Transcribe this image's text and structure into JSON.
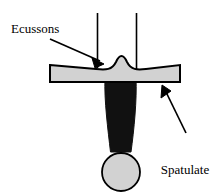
{
  "figure": {
    "background_color": "#ffffff",
    "width": 221,
    "height": 196
  },
  "labels": {
    "ecussons": {
      "text": "Ecussons",
      "points_to": "central-bump"
    },
    "spatulate": {
      "line1": "Spatulate",
      "line2": "ends",
      "points_to": "horizontal-bar-right"
    }
  },
  "colors": {
    "outline": "#000000",
    "gray_fill": "#d2d2d2",
    "dark_fill": "#111111",
    "background": "#ffffff"
  },
  "shapes": {
    "horizontal_bar": {
      "name": "spatulate-bar",
      "fill": "#d2d2d2",
      "stroke": "#000000",
      "left": 50,
      "right": 180,
      "top": 65,
      "bottom": 82
    },
    "central_bump": {
      "name": "ecussons-bump",
      "peak_x": 120,
      "peak_y": 57
    },
    "stem": {
      "name": "dark-stem",
      "fill": "#111111",
      "top": 82,
      "bottom": 158,
      "top_width": 31,
      "bottom_width": 21
    },
    "circle": {
      "name": "terminal-circle",
      "fill": "#d2d2d2",
      "stroke": "#000000",
      "center_x": 121,
      "center_y": 172,
      "radius": 19
    },
    "vertical_line_left": {
      "name": "guide-line-left",
      "x": 97,
      "top": 13,
      "bottom": 68
    },
    "vertical_line_right": {
      "name": "guide-line-right",
      "x": 136,
      "top": 13,
      "bottom": 70
    },
    "arrow_ecussons": {
      "name": "arrow-to-ecussons",
      "tail_x": 50,
      "tail_y": 39,
      "tip_x": 105,
      "tip_y": 64
    },
    "arrow_spatulate": {
      "name": "arrow-to-spatulate",
      "tail_x": 186,
      "tail_y": 133,
      "tip_x": 162,
      "tip_y": 85
    }
  }
}
